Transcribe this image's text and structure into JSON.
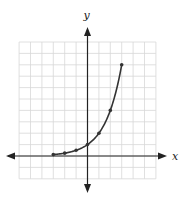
{
  "chart_data": {
    "type": "line",
    "title": "",
    "xlabel": "x",
    "ylabel": "y",
    "xlim": [
      -6,
      6
    ],
    "ylim": [
      -2,
      10
    ],
    "grid": true,
    "grid_step": 1,
    "tick_labels_shown": false,
    "series": [
      {
        "name": "y = 2^x",
        "x": [
          -3,
          -2,
          -1,
          0,
          1,
          2,
          3
        ],
        "y": [
          0.125,
          0.25,
          0.5,
          1,
          2,
          4,
          8
        ],
        "markers": true
      }
    ]
  },
  "axes": {
    "x_label": "x",
    "y_label": "y"
  },
  "colors": {
    "grid": "#d8d8d8",
    "axis": "#222222",
    "curve": "#333333",
    "background": "#ffffff"
  }
}
